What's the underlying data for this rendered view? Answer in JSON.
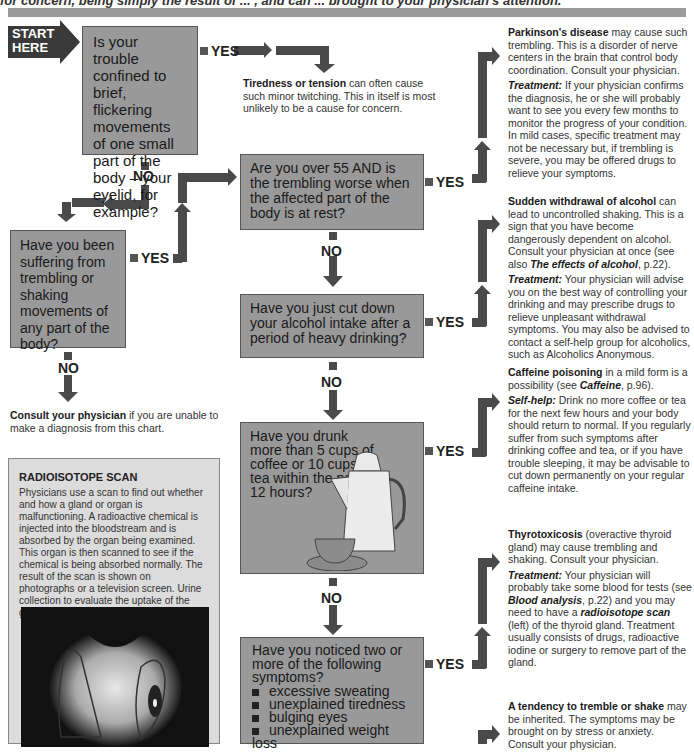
{
  "header": {
    "top_line": "for concern, being simply the result of ... , and can ... brought to your physician's attention."
  },
  "start": {
    "label_line1": "START",
    "label_line2": "HERE"
  },
  "questions": [
    {
      "id": "q1",
      "text": "Is your trouble confined to brief, flickering movements of one small part of the body – your eyelid, for example?"
    },
    {
      "id": "q2",
      "text": "Have you been suffering from trembling or shaking movements of any part of the body?"
    },
    {
      "id": "q3",
      "text": "Are you over 55 AND is the trembling worse when the affected part of the body is at rest?"
    },
    {
      "id": "q4",
      "text": "Have you just cut down your alcohol intake after a period of heavy drinking?"
    },
    {
      "id": "q5",
      "text": "Have you drunk more than 5 cups of coffee or 10 cups of tea within the past 12 hours?"
    },
    {
      "id": "q6",
      "text": "Have you noticed two or more of the following symptoms?",
      "bullets": [
        "excessive sweating",
        "unexplained tiredness",
        "bulging eyes",
        "unexplained weight loss"
      ]
    }
  ],
  "labels": {
    "yes": "YES",
    "no": "NO"
  },
  "outcomes": {
    "tiredness": {
      "title": "Tiredness or tension",
      "text": " can often cause such minor twitching. This in itself is most unlikely to be a cause for concern."
    },
    "consult": {
      "title": "Consult your physician",
      "text": " if you are unable to make a diagnosis from this chart."
    },
    "parkinsons": {
      "title": "Parkinson's disease",
      "text": " may cause such trembling. This is a disorder of nerve centers in the brain that control body coordination. Consult your physician.",
      "sub_label": "Treatment:",
      "sub_text": " If your physician confirms the diagnosis, he or she will probably want to see you every few months to monitor the progress of your condition. In mild cases, specific treatment may not be necessary but, if trembling is severe, you may be offered drugs to relieve your symptoms."
    },
    "alcohol": {
      "title": "Sudden withdrawal of alcohol",
      "text": " can lead to uncontrolled shaking. This is a sign that you have become dangerously dependent on alcohol. Consult your physician at once (see also ",
      "ref": "The effects of alcohol",
      "ref_page": ", p.22).",
      "sub_label": "Treatment:",
      "sub_text": " Your physician will advise you on the best way of controlling your drinking and may prescribe drugs to relieve unpleasant withdrawal symptoms. You may also be advised to contact a self-help group for alcoholics, such as Alcoholics Anonymous."
    },
    "caffeine": {
      "title": "Caffeine poisoning",
      "text": " in a mild form is a possibility (see ",
      "ref": "Caffeine",
      "ref_page": ", p.96).",
      "sub_label": "Self-help:",
      "sub_text": " Drink no more coffee or tea for the next few hours and your body should return to normal. If you regularly suffer from such symptoms after drinking coffee and tea, or if you have trouble sleeping, it may be advisable to cut down permanently on your regular caffeine intake."
    },
    "thyro": {
      "title": "Thyrotoxicosis",
      "text": " (overactive thyroid gland) may cause trembling and shaking. Consult your physician.",
      "sub_label": "Treatment:",
      "sub_text1": " Your physician will probably take some blood for tests (see ",
      "ref1": "Blood analysis",
      "ref1_page": ", p.22) and you may need to have a ",
      "ref2": "radioisotope scan",
      "sub_text2": " (left) of the thyroid gland. Treatment usually consists of drugs, radioactive iodine or surgery to remove part of the gland."
    },
    "inherited": {
      "title": "A tendency to tremble or shake",
      "text": " may be inherited. The symptoms may be brought on by stress or anxiety. Consult your physician."
    }
  },
  "radioisotope": {
    "title": "RADIOISOTOPE SCAN",
    "body": "Physicians use a scan to find out whether and how a gland or organ is malfunctioning. A radioactive chemical is injected into the bloodstream and is absorbed by the organ being examined. This organ is then scanned to see if the chemical is being absorbed normally. The result of the scan is shown on photographs or a television screen. Urine collection to evaluate the uptake of the gland may also be done."
  },
  "colors": {
    "box_fill": "#999999",
    "arrow": "#4a4a4a",
    "start": "#3a3a3a",
    "panel": "#dcdcdc"
  }
}
